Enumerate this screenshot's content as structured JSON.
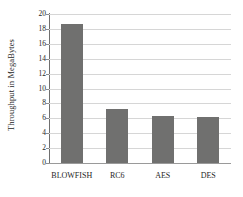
{
  "chart_data": {
    "type": "bar",
    "title": "",
    "subtitle": "",
    "xlabel": "",
    "ylabel": "Throughput in MegaBytes",
    "categories": [
      "BLOWFISH",
      "RC6",
      "AES",
      "DES"
    ],
    "values": [
      18.7,
      7.3,
      6.3,
      6.15
    ],
    "series": [
      {
        "name": "Throughput",
        "values": [
          18.7,
          7.3,
          6.3,
          6.15
        ]
      }
    ],
    "ylim": [
      0,
      20
    ],
    "xlim": [
      0,
      4
    ],
    "ytick_step": 2,
    "ytick_labels": [
      "20",
      "18",
      "16",
      "14",
      "12",
      "10",
      "8",
      "6",
      "4",
      "2",
      "0"
    ],
    "ytick_values": [
      20,
      18,
      16,
      14,
      12,
      10,
      8,
      6,
      4,
      2,
      0
    ],
    "grid": true,
    "grid_axis": "y",
    "legend": false,
    "legend_position": "none",
    "annotations": [],
    "colors": {
      "bar": "#70706f",
      "gridline": "#d6d6d6",
      "axis": "#6f6f6f",
      "baseline": "#9a9a9a",
      "background": "#ffffff",
      "text": "#1e1e1e"
    }
  }
}
